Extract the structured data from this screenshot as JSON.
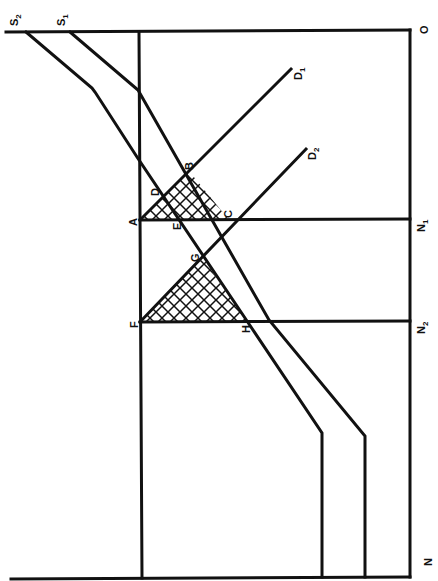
{
  "diagram": {
    "title": "",
    "orientation": "rotated 90 degrees clockwise",
    "colors": {
      "line": "#111111",
      "background": "#ffffff"
    },
    "axis_labels": {
      "origin": "O",
      "quantity_axis": "N",
      "n1": "N",
      "n1_sub": "1",
      "n2": "N",
      "n2_sub": "2"
    },
    "curves": {
      "s1": {
        "label": "S",
        "sub": "1"
      },
      "s2": {
        "label": "S",
        "sub": "2"
      },
      "d1": {
        "label": "D",
        "sub": "1"
      },
      "d2": {
        "label": "D",
        "sub": "2"
      }
    },
    "points": {
      "a": "A",
      "b": "B",
      "c": "C",
      "d": "D",
      "e": "E",
      "f": "F",
      "g": "G",
      "h": "H"
    },
    "shaded_regions": [
      "triangle ABC",
      "triangle FGH"
    ]
  }
}
